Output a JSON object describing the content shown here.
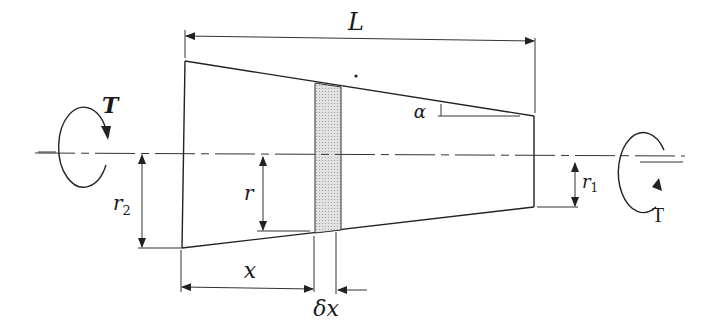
{
  "diagram": {
    "labels": {
      "length": "L",
      "torque_left": "T",
      "torque_right": "T",
      "radius_large": "r",
      "radius_large_sub": "2",
      "radius_small": "r",
      "radius_small_sub": "1",
      "radius_general": "r",
      "angle": "α",
      "position": "x",
      "element_width": "δx"
    },
    "colors": {
      "line": "#222222",
      "element_fill": "#d6d6d6",
      "background": "#ffffff"
    }
  }
}
